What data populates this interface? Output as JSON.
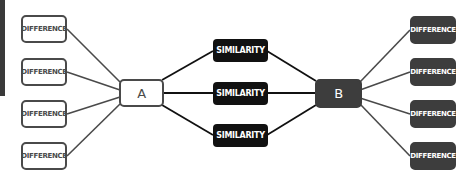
{
  "diagram": {
    "node_a": {
      "label": "A"
    },
    "node_b": {
      "label": "B"
    },
    "similarities": [
      {
        "label": "SIMILARITY"
      },
      {
        "label": "SIMILARITY"
      },
      {
        "label": "SIMILARITY"
      }
    ],
    "left_differences": [
      {
        "label": "DIFFERENCE"
      },
      {
        "label": "DIFFERENCE"
      },
      {
        "label": "DIFFERENCE"
      },
      {
        "label": "DIFFERENCE"
      }
    ],
    "right_differences": [
      {
        "label": "DIFFERENCE"
      },
      {
        "label": "DIFFERENCE"
      },
      {
        "label": "DIFFERENCE"
      },
      {
        "label": "DIFFERENCE"
      }
    ],
    "colors": {
      "outline": "#4a4a4a",
      "dark_fill": "#3d3d3d",
      "similarity_fill": "#111111",
      "background": "#ffffff"
    }
  }
}
